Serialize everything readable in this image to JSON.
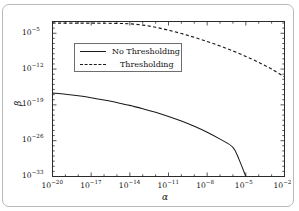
{
  "chart_data": {
    "type": "line",
    "title": "",
    "xlabel": "α",
    "ylabel": "β",
    "xscale": "log",
    "yscale": "log",
    "xlim": [
      1e-20,
      0.01
    ],
    "ylim": [
      1e-33,
      0.002
    ],
    "grid": false,
    "legend_position": "upper-left-center",
    "xticks": [
      {
        "value": 1e-20,
        "label": "10",
        "exp": "−20"
      },
      {
        "value": 1e-17,
        "label": "10",
        "exp": "−17"
      },
      {
        "value": 1e-14,
        "label": "10",
        "exp": "−14"
      },
      {
        "value": 1e-11,
        "label": "10",
        "exp": "−11"
      },
      {
        "value": 1e-08,
        "label": "10",
        "exp": "−8"
      },
      {
        "value": 1e-05,
        "label": "10",
        "exp": "−5"
      },
      {
        "value": 0.01,
        "label": "10",
        "exp": "−2"
      }
    ],
    "yticks": [
      {
        "value": 1e-05,
        "label": "10",
        "exp": "−5"
      },
      {
        "value": 1e-12,
        "label": "10",
        "exp": "−12"
      },
      {
        "value": 1e-19,
        "label": "10",
        "exp": "−19"
      },
      {
        "value": 1e-26,
        "label": "10",
        "exp": "−26"
      },
      {
        "value": 1e-33,
        "label": "10",
        "exp": "−33"
      }
    ],
    "series": [
      {
        "name": "No Thresholding",
        "style": "solid",
        "color": "#1a1a1a",
        "points": [
          [
            1e-20,
            2e-17
          ],
          [
            1e-19,
            1.2e-17
          ],
          [
            1e-18,
            6e-18
          ],
          [
            1e-17,
            2.5e-18
          ],
          [
            1e-16,
            9e-19
          ],
          [
            1e-15,
            2.8e-19
          ],
          [
            1e-14,
            8e-20
          ],
          [
            1e-13,
            1.8e-20
          ],
          [
            1e-12,
            3.5e-21
          ],
          [
            1e-11,
            5.5e-22
          ],
          [
            1e-10,
            7e-23
          ],
          [
            1e-09,
            6.5e-24
          ],
          [
            1e-08,
            4.5e-25
          ],
          [
            1e-07,
            2e-26
          ],
          [
            1e-06,
            5e-28
          ],
          [
            3e-06,
            2e-30
          ],
          [
            1e-05,
            1e-33
          ]
        ]
      },
      {
        "name": "Thresholding",
        "style": "dashed",
        "color": "#1a1a1a",
        "points": [
          [
            1e-20,
            0.001
          ],
          [
            1e-17,
            0.00095
          ],
          [
            1e-15,
            0.00085
          ],
          [
            1e-14,
            0.0007
          ],
          [
            1e-13,
            0.0004
          ],
          [
            1e-12,
            0.00015
          ],
          [
            1e-11,
            4e-05
          ],
          [
            1e-10,
            9e-06
          ],
          [
            1e-09,
            1.6e-06
          ],
          [
            1e-08,
            2.5e-07
          ],
          [
            1e-07,
            3.2e-08
          ],
          [
            1e-06,
            3.5e-09
          ],
          [
            1e-05,
            3e-10
          ],
          [
            0.0001,
            2e-11
          ],
          [
            0.001,
            1e-12
          ],
          [
            0.01,
            3e-14
          ]
        ]
      }
    ]
  },
  "legend": {
    "items": [
      {
        "label": "No Thresholding",
        "style": "solid"
      },
      {
        "label": "Thresholding",
        "style": "dashed"
      }
    ]
  },
  "caption_strip": ""
}
